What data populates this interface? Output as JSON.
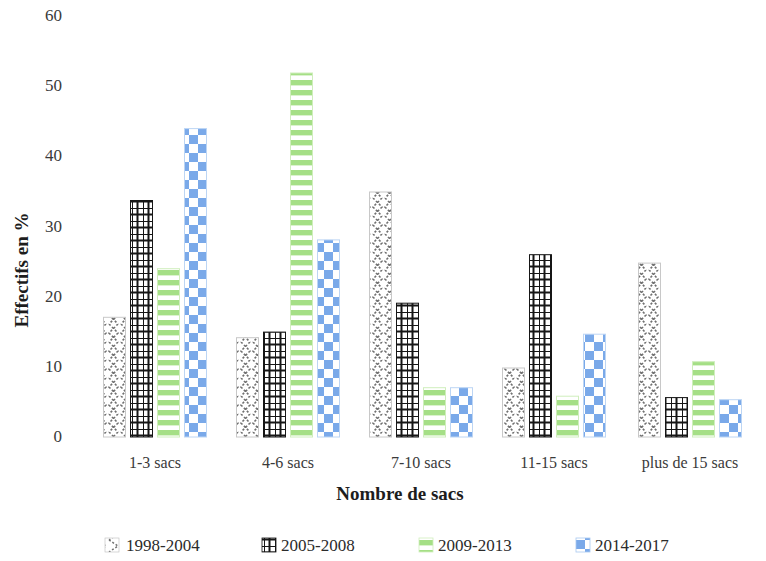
{
  "chart_data": {
    "type": "bar",
    "title": "",
    "xlabel": "Nombre de sacs",
    "ylabel": "Effectifs en %",
    "categories": [
      "1-3 sacs",
      "4-6 sacs",
      "7-10 sacs",
      "11-15 sacs",
      "plus de 15 sacs"
    ],
    "series": [
      {
        "name": "1998-2004",
        "values": [
          17.0,
          14.1,
          34.8,
          9.8,
          24.7
        ],
        "color": "#6b6b6b",
        "pattern": "zigzag-gray"
      },
      {
        "name": "2005-2008",
        "values": [
          33.6,
          14.9,
          19.0,
          25.9,
          5.6
        ],
        "color": "#1a1a1a",
        "pattern": "grid-black"
      },
      {
        "name": "2009-2013",
        "values": [
          23.9,
          51.7,
          7.0,
          5.8,
          10.7
        ],
        "color": "#a8e08a",
        "pattern": "hlines-green"
      },
      {
        "name": "2014-2017",
        "values": [
          43.8,
          28.0,
          7.0,
          14.6,
          5.3
        ],
        "color": "#7aa9e9",
        "pattern": "checker-blue"
      }
    ],
    "ylim": [
      0,
      60
    ],
    "yticks": [
      0,
      10,
      20,
      30,
      40,
      50,
      60
    ],
    "ytick_labels": [
      "0",
      "10",
      "20",
      "30",
      "40",
      "50",
      "60"
    ],
    "grid": false,
    "legend_position": "bottom"
  },
  "legend": {
    "items": [
      {
        "label": "1998-2004"
      },
      {
        "label": "2005-2008"
      },
      {
        "label": "2009-2013"
      },
      {
        "label": "2014-2017"
      }
    ]
  }
}
